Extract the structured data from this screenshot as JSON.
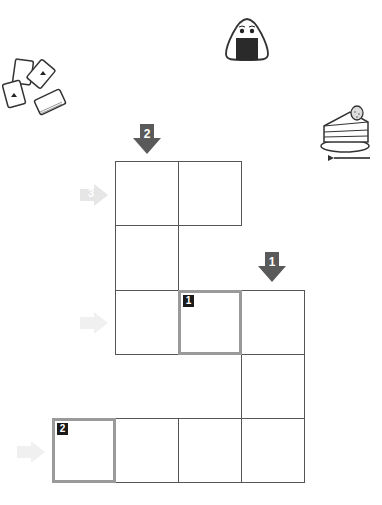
{
  "puzzle": {
    "type": "crossword-grid",
    "cell_size": 64,
    "grid_origin": {
      "x": 52,
      "y": 161
    },
    "cells": [
      {
        "row": 0,
        "col": 1
      },
      {
        "row": 0,
        "col": 2
      },
      {
        "row": 1,
        "col": 1
      },
      {
        "row": 2,
        "col": 1
      },
      {
        "row": 2,
        "col": 2,
        "clue": "1",
        "highlighted": true
      },
      {
        "row": 2,
        "col": 3
      },
      {
        "row": 3,
        "col": 3
      },
      {
        "row": 4,
        "col": 0,
        "clue": "2",
        "highlighted": true
      },
      {
        "row": 4,
        "col": 1
      },
      {
        "row": 4,
        "col": 2
      },
      {
        "row": 4,
        "col": 3
      }
    ],
    "down_clues": [
      {
        "number": "2",
        "col": 1
      },
      {
        "number": "1",
        "col": 3
      }
    ],
    "across_clues": [
      {
        "number": "3",
        "row": 0
      },
      {
        "number": "",
        "row": 2
      },
      {
        "number": "",
        "row": 4
      }
    ]
  },
  "colors": {
    "arrow_dark": "#5a5a5a",
    "arrow_faint": "#e6e6e6",
    "grid_line": "#555555",
    "highlight_border": "#9a9a9a"
  },
  "illustrations": [
    {
      "name": "playing-cards-icon"
    },
    {
      "name": "onigiri-icon"
    },
    {
      "name": "cake-slice-icon"
    }
  ]
}
